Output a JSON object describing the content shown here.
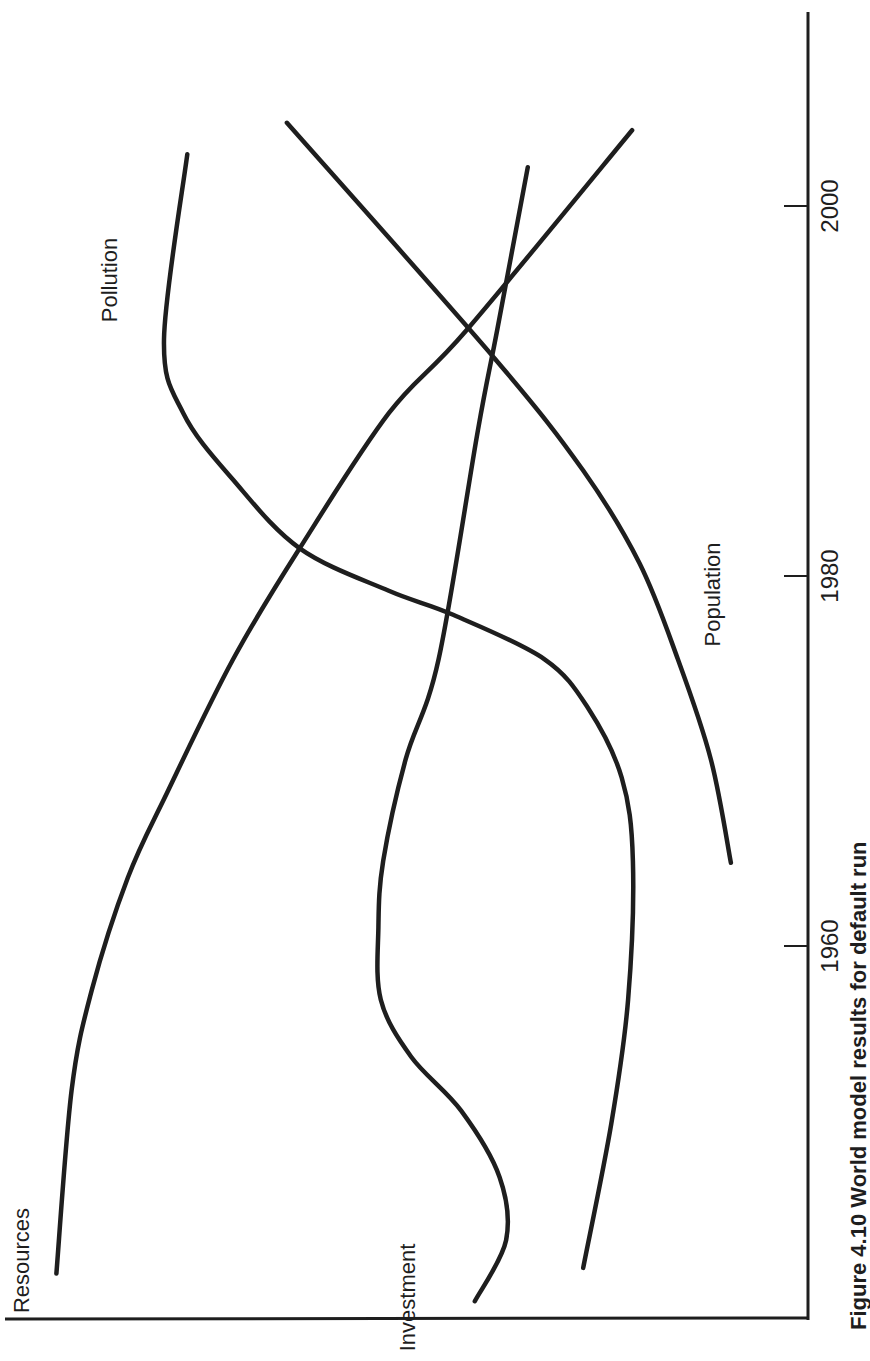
{
  "chart_data": {
    "type": "line",
    "orientation": "rotated-90-ccw",
    "title": "",
    "caption": "Figure 4.10 World model results for default run",
    "xlabel": "",
    "ylabel": "",
    "xlim": [
      1940,
      2010
    ],
    "ylim": [
      0,
      100
    ],
    "xticks": [
      {
        "value": 1960,
        "label": "1960"
      },
      {
        "value": 1980,
        "label": "1980"
      },
      {
        "value": 2000,
        "label": "2000"
      }
    ],
    "grid": false,
    "legend": "inline-labels",
    "series": [
      {
        "name": "Resources",
        "label": "Resources",
        "label_at": [
          1943,
          97
        ],
        "points": [
          [
            1942.3,
            93.6
          ],
          [
            1952.2,
            91.7
          ],
          [
            1957.6,
            89.2
          ],
          [
            1963.7,
            84.7
          ],
          [
            1968.3,
            79.8
          ],
          [
            1975.5,
            71.6
          ],
          [
            1981.5,
            63.3
          ],
          [
            1988.8,
            52.2
          ],
          [
            1993.3,
            42.5
          ],
          [
            2004.1,
            21.9
          ]
        ]
      },
      {
        "name": "Investment",
        "label": "Investment",
        "label_at": [
          1941,
          49
        ],
        "points": [
          [
            1940.8,
            41.5
          ],
          [
            1944.1,
            37.6
          ],
          [
            1947.5,
            38.4
          ],
          [
            1951.1,
            43.2
          ],
          [
            1954.0,
            49.4
          ],
          [
            1957.1,
            53.2
          ],
          [
            1961.0,
            53.5
          ],
          [
            1964.6,
            52.9
          ],
          [
            1970.1,
            50.1
          ],
          [
            1975.5,
            46.0
          ],
          [
            1987.9,
            41.1
          ],
          [
            1993.3,
            38.7
          ],
          [
            2002.1,
            34.9
          ]
        ]
      },
      {
        "name": "Pollution",
        "label": "Pollution",
        "label_at": [
          1996,
          86
        ],
        "points": [
          [
            1942.6,
            28.0
          ],
          [
            1950.4,
            24.5
          ],
          [
            1957.1,
            22.4
          ],
          [
            1964.6,
            21.8
          ],
          [
            1969.1,
            23.2
          ],
          [
            1972.8,
            27.3
          ],
          [
            1975.5,
            32.8
          ],
          [
            1977.9,
            44.2
          ],
          [
            1979.2,
            52.2
          ],
          [
            1981.5,
            63.3
          ],
          [
            1985.2,
            71.6
          ],
          [
            1988.8,
            77.8
          ],
          [
            1992.8,
            80.2
          ],
          [
            2002.8,
            77.3
          ]
        ]
      },
      {
        "name": "Population",
        "label": "Population",
        "label_at": [
          1979,
          11
        ],
        "points": [
          [
            1964.5,
            9.6
          ],
          [
            1970.1,
            12.1
          ],
          [
            1975.5,
            16.2
          ],
          [
            1980.7,
            21.0
          ],
          [
            1985.7,
            28.0
          ],
          [
            1991.8,
            39.1
          ],
          [
            2004.5,
            64.9
          ]
        ]
      }
    ]
  }
}
